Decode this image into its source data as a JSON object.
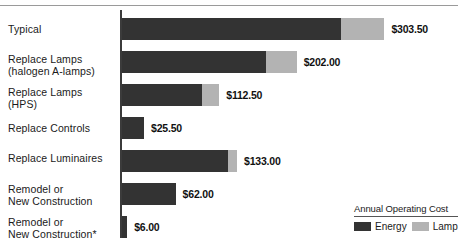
{
  "chart_data": {
    "type": "bar",
    "orientation": "horizontal",
    "stacked": true,
    "title": "",
    "xlabel": "",
    "ylabel": "",
    "categories": [
      "Typical",
      "Replace Lamps (halogen A-lamps)",
      "Replace Lamps (HPS)",
      "Replace Controls",
      "Replace Luminaires",
      "Remodel or New Construction",
      "Remodel or New Construction*"
    ],
    "series": [
      {
        "name": "Energy",
        "color": "#333333",
        "values": [
          253.5,
          166.0,
          92.5,
          25.5,
          123.0,
          62.0,
          6.0
        ]
      },
      {
        "name": "Lamp",
        "color": "#b3b3b3",
        "values": [
          50.0,
          36.0,
          20.0,
          0.0,
          10.0,
          0.0,
          0.0
        ]
      }
    ],
    "totals": [
      303.5,
      202.0,
      112.5,
      25.5,
      133.0,
      62.0,
      6.0
    ],
    "value_labels": [
      "$303.50",
      "$202.00",
      "$112.50",
      "$25.50",
      "$133.00",
      "$62.00",
      "$6.00"
    ],
    "xlim": [
      0,
      340
    ],
    "grid": false,
    "legend_position": "bottom-right"
  },
  "rows": [
    {
      "label_line1": "Typical",
      "label_line2": "",
      "value": "$303.50",
      "energy": 253.5,
      "lamp": 50.0
    },
    {
      "label_line1": "Replace Lamps",
      "label_line2": "(halogen A-lamps)",
      "value": "$202.00",
      "energy": 166.0,
      "lamp": 36.0
    },
    {
      "label_line1": "Replace Lamps",
      "label_line2": "(HPS)",
      "value": "$112.50",
      "energy": 92.5,
      "lamp": 20.0
    },
    {
      "label_line1": "Replace Controls",
      "label_line2": "",
      "value": "$25.50",
      "energy": 25.5,
      "lamp": 0.0
    },
    {
      "label_line1": "Replace Luminaires",
      "label_line2": "",
      "value": "$133.00",
      "energy": 123.0,
      "lamp": 10.0
    },
    {
      "label_line1": "Remodel or",
      "label_line2": "New Construction",
      "value": "$62.00",
      "energy": 62.0,
      "lamp": 0.0
    },
    {
      "label_line1": "Remodel or",
      "label_line2": "New Construction*",
      "value": "$6.00",
      "energy": 6.0,
      "lamp": 0.0
    }
  ],
  "legend": {
    "title": "Annual Operating Cost",
    "entries": [
      {
        "label": "Energy",
        "color": "#333333"
      },
      {
        "label": "Lamp",
        "color": "#b3b3b3"
      }
    ]
  },
  "colors": {
    "energy": "#333333",
    "lamp": "#b3b3b3",
    "axis": "#3b3b3b",
    "rule": "#9a9a9a",
    "text": "#1a1a1a"
  }
}
